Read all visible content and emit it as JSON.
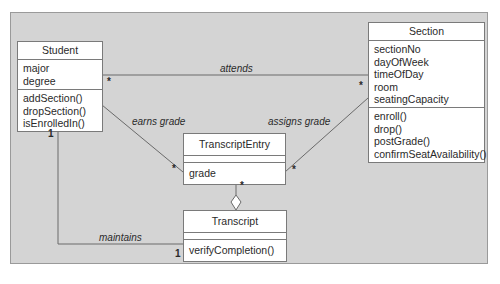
{
  "diagram": {
    "type": "UML class diagram",
    "classes": {
      "student": {
        "name": "Student",
        "attributes": [
          "major",
          "degree"
        ],
        "operations": [
          "addSection()",
          "dropSection()",
          "isEnrolledIn()"
        ]
      },
      "section": {
        "name": "Section",
        "attributes": [
          "sectionNo",
          "dayOfWeek",
          "timeOfDay",
          "room",
          "seatingCapacity"
        ],
        "operations": [
          "enroll()",
          "drop()",
          "postGrade()",
          "confirmSeatAvailability()"
        ]
      },
      "transcript_entry": {
        "name": "TranscriptEntry",
        "attributes": [],
        "operations": [
          "grade"
        ]
      },
      "transcript": {
        "name": "Transcript",
        "attributes": [],
        "operations": [
          "verifyCompletion()"
        ]
      }
    },
    "associations": {
      "attends": {
        "label": "attends",
        "from": "Student",
        "to": "Section",
        "from_multiplicity": "*",
        "to_multiplicity": "*"
      },
      "earns_grade": {
        "label": "earns grade",
        "from": "Student",
        "to": "TranscriptEntry",
        "to_multiplicity": "*"
      },
      "assigns_grade": {
        "label": "assigns grade",
        "from": "Section",
        "to": "TranscriptEntry",
        "to_multiplicity": "*"
      },
      "maintains": {
        "label": "maintains",
        "from": "Student",
        "to": "Transcript",
        "from_multiplicity": "1",
        "to_multiplicity": "1"
      },
      "aggregation": {
        "whole": "Transcript",
        "part": "TranscriptEntry",
        "part_multiplicity": "*",
        "symbol": "hollow-diamond"
      }
    },
    "colors": {
      "background": "#d4d4d4",
      "box_fill": "#ffffff",
      "line": "#6a6a6a",
      "text": "#2a2a2a"
    }
  }
}
